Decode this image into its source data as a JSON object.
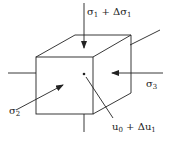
{
  "diagram": {
    "labels": {
      "sigma1": {
        "base": "σ",
        "sub": "1",
        "rest": " + Δσ",
        "sub2": "1"
      },
      "sigma2": {
        "base": "σ",
        "sub": "2"
      },
      "sigma3": {
        "base": "σ",
        "sub": "3"
      },
      "u": {
        "base": "u",
        "sub": "0",
        "rest": " + Δu",
        "sub2": "1"
      }
    },
    "colors": {
      "stroke": "#222222",
      "background": "#ffffff"
    }
  }
}
